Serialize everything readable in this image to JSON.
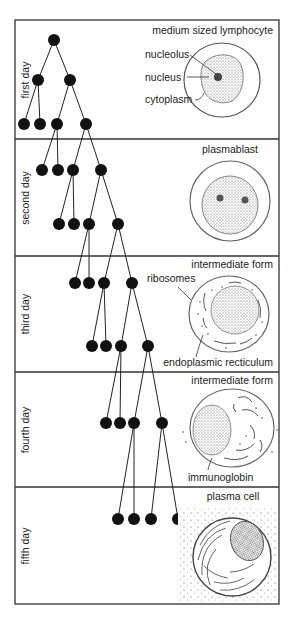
{
  "diagram": {
    "panels": [
      {
        "day_label": "first day",
        "cell_title": "medium sized lymphocyte",
        "annotations": [
          "nucleolus",
          "nucleus",
          "cytoplasm"
        ]
      },
      {
        "day_label": "second day",
        "cell_title": "plasmablast",
        "annotations": []
      },
      {
        "day_label": "third day",
        "cell_title": "intermediate form",
        "annotations": [
          "ribosomes",
          "endoplasmic recticulum"
        ]
      },
      {
        "day_label": "fourth day",
        "cell_title": "intermediate form",
        "annotations": [
          "immunoglobin"
        ]
      },
      {
        "day_label": "fifth day",
        "cell_title": "plasma cell",
        "annotations": []
      }
    ],
    "tree_levels": [
      {
        "y": 40,
        "xs": [
          54
        ]
      },
      {
        "y": 80,
        "xs": [
          38,
          70
        ]
      },
      {
        "y": 124,
        "xs": [
          24,
          40,
          57,
          86
        ]
      },
      {
        "y": 170,
        "xs": [
          42,
          58,
          73,
          101
        ]
      },
      {
        "y": 224,
        "xs": [
          59,
          74,
          89,
          118
        ]
      },
      {
        "y": 283,
        "xs": [
          75,
          89,
          104,
          132
        ]
      },
      {
        "y": 346,
        "xs": [
          92,
          106,
          121,
          148
        ]
      },
      {
        "y": 423,
        "xs": [
          106,
          120,
          134,
          162
        ]
      },
      {
        "y": 519,
        "xs": [
          118,
          134,
          151,
          178
        ]
      }
    ],
    "colors": {
      "line": "#222222",
      "node": "#111111",
      "background": "#ffffff"
    }
  }
}
